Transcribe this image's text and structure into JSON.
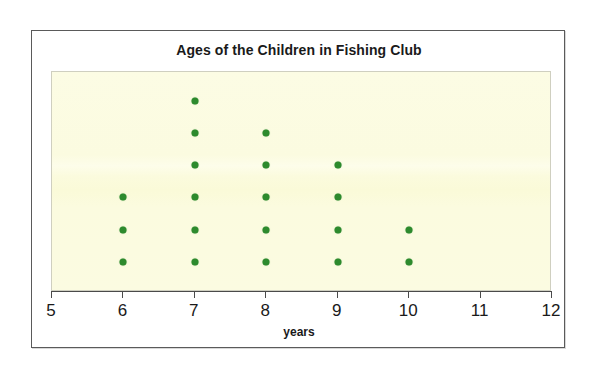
{
  "chart_data": {
    "type": "scatter",
    "plot_style": "dot-plot",
    "title": "Ages of the Children in Fishing Club",
    "xlabel": "years",
    "ylabel": "",
    "xlim": [
      5,
      12
    ],
    "x_ticks": [
      5,
      6,
      7,
      8,
      9,
      10,
      11,
      12
    ],
    "x_tick_labels": [
      "5",
      "6",
      "7",
      "8",
      "9",
      "10",
      "11",
      "12"
    ],
    "grid": false,
    "legend": null,
    "categories": [
      5,
      6,
      7,
      8,
      9,
      10,
      11,
      12
    ],
    "values": [
      0,
      3,
      6,
      5,
      4,
      2,
      0,
      0
    ],
    "total_count": 20,
    "dot_color": "#2d8a2d",
    "plot_background": "#fbfbe0",
    "frame_color": "#5a5a5a",
    "text_color": "#1a1a1a"
  },
  "figure": {
    "title": "Ages of the Children in Fishing Club",
    "axis_label": "years"
  }
}
